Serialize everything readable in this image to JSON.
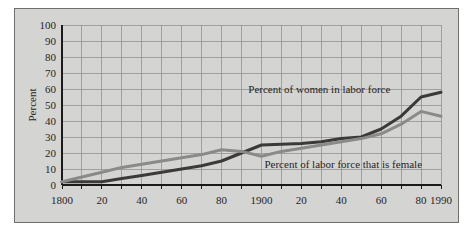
{
  "figure": {
    "panel_color": "#d4d4d2",
    "frame_color": "#6f6f6d",
    "page_color": "#ffffff"
  },
  "chart_data": {
    "type": "line",
    "title": "",
    "subtitle": "",
    "xlabel": "",
    "ylabel": "Percent",
    "xlim": [
      1800,
      1990
    ],
    "ylim": [
      0,
      100
    ],
    "grid": true,
    "legend_position": "inline-annotations",
    "y_ticks": [
      0,
      10,
      20,
      30,
      40,
      50,
      60,
      70,
      80,
      90,
      100
    ],
    "y_tick_labels": [
      "0",
      "10",
      "20",
      "30",
      "40",
      "50",
      "60",
      "70",
      "80",
      "90",
      "100"
    ],
    "x_ticks": [
      1800,
      1810,
      1820,
      1830,
      1840,
      1850,
      1860,
      1870,
      1880,
      1890,
      1900,
      1910,
      1920,
      1930,
      1940,
      1950,
      1960,
      1970,
      1980,
      1990
    ],
    "x_labeled_ticks": [
      1800,
      1820,
      1840,
      1860,
      1880,
      1900,
      1920,
      1940,
      1960,
      1980,
      1990
    ],
    "x_tick_labels": [
      "1800",
      "20",
      "40",
      "60",
      "80",
      "1900",
      "20",
      "40",
      "60",
      "80",
      "1990"
    ],
    "series": [
      {
        "name": "Percent of women in labor force",
        "color": "#3c3a38",
        "width": 3.0,
        "annotation": "Percent of women in labor force",
        "x": [
          1800,
          1810,
          1820,
          1830,
          1840,
          1850,
          1860,
          1870,
          1880,
          1890,
          1900,
          1910,
          1920,
          1930,
          1940,
          1950,
          1960,
          1970,
          1980,
          1990
        ],
        "values": [
          2,
          2,
          2,
          4,
          6,
          8,
          10,
          12,
          15,
          20,
          25,
          25.5,
          26,
          27,
          29,
          30,
          35,
          43,
          55,
          58
        ]
      },
      {
        "name": "Percent of labor force that is female",
        "color": "#8a8a88",
        "width": 3.0,
        "annotation": "Percent of labor force that is female",
        "x": [
          1800,
          1810,
          1820,
          1830,
          1840,
          1850,
          1860,
          1870,
          1880,
          1890,
          1900,
          1910,
          1920,
          1930,
          1940,
          1950,
          1960,
          1970,
          1980,
          1990
        ],
        "values": [
          2,
          5,
          8,
          11,
          13,
          15,
          17,
          19,
          22,
          21,
          18,
          21,
          23,
          25,
          27,
          29,
          32,
          38,
          46,
          43
        ]
      }
    ],
    "annotations": [
      {
        "text": "Percent of women in labor force",
        "x": 1929,
        "y": 60,
        "anchor": "middle"
      },
      {
        "text": "Percent of labor force that is female",
        "x": 1941,
        "y": 13,
        "anchor": "middle"
      }
    ]
  }
}
